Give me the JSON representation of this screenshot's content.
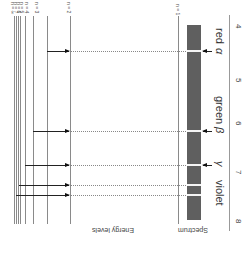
{
  "diagram": {
    "title_left": "Energy levels",
    "title_right": "Spectrum",
    "levels": [
      {
        "label": "n = ∞",
        "x": 14
      },
      {
        "label": "n = 7",
        "x": 16
      },
      {
        "label": "n = 6",
        "x": 18
      },
      {
        "label": "n = 5",
        "x": 20
      },
      {
        "label": "n = 4",
        "x": 25
      },
      {
        "label": "n = 3",
        "x": 33
      },
      {
        "label": "n = 2",
        "x": 47
      },
      {
        "label": "n = 1",
        "x": 70
      }
    ],
    "ground_level": {
      "label": "n = 1"
    },
    "transitions": [
      {
        "name": "alpha",
        "symbol": "α",
        "color_label": "red",
        "from": "n = 3",
        "to": "n = 2",
        "y": 51
      },
      {
        "name": "beta",
        "symbol": "β",
        "color_label": "green",
        "from": "n = 4",
        "to": "n = 2",
        "y": 131
      },
      {
        "name": "gamma",
        "symbol": "γ",
        "color_label": "",
        "from": "n = 5",
        "to": "n = 2",
        "y": 165
      },
      {
        "name": "delta",
        "symbol": "",
        "color_label": "",
        "from": "n = 6",
        "to": "n = 2",
        "y": 185
      },
      {
        "name": "epsilon",
        "symbol": "",
        "color_label": "",
        "from": "n = 7",
        "to": "n = 2",
        "y": 195
      }
    ],
    "spectrum_labels": {
      "alpha": "α",
      "red": "red",
      "beta": "β",
      "green": "green",
      "gamma": "γ",
      "violet": "violet"
    },
    "axis_ticks": [
      "4",
      "5",
      "6",
      "7",
      "8"
    ],
    "colors": {
      "spectrum_bar": "#5f5f5f",
      "level_line": "#8a8a8a",
      "arrow": "#111111"
    }
  }
}
